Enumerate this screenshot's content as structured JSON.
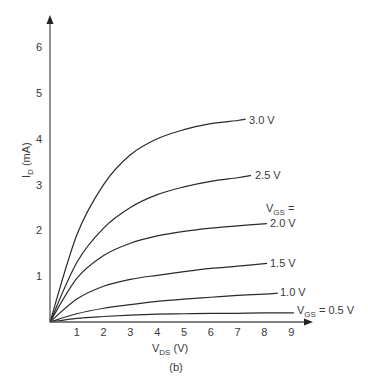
{
  "chart_data": {
    "type": "line",
    "title": "",
    "caption": "(b)",
    "xlabel": "V_DS (V)",
    "ylabel": "I_D (mA)",
    "xlim": [
      0,
      10
    ],
    "ylim": [
      0,
      6.8
    ],
    "grid": false,
    "x_ticks": [
      1,
      2,
      3,
      4,
      5,
      6,
      7,
      8,
      9
    ],
    "y_ticks": [
      1,
      2,
      3,
      4,
      5,
      6
    ],
    "legend": "inline labels at curve ends",
    "series": [
      {
        "name": "V_GS = 0.5 V",
        "label": "V_GS = 0.5 V",
        "x": [
          0,
          1,
          2,
          3,
          4,
          5,
          6,
          7,
          8,
          9.1
        ],
        "y": [
          0,
          0.08,
          0.12,
          0.15,
          0.17,
          0.18,
          0.19,
          0.19,
          0.2,
          0.2
        ]
      },
      {
        "name": "1.0 V",
        "label": "1.0 V",
        "x": [
          0,
          1,
          2,
          3,
          4,
          5,
          6,
          7,
          8,
          8.5
        ],
        "y": [
          0,
          0.18,
          0.3,
          0.38,
          0.45,
          0.5,
          0.54,
          0.58,
          0.61,
          0.63
        ]
      },
      {
        "name": "1.5 V",
        "label": "1.5 V",
        "x": [
          0,
          1,
          2,
          3,
          4,
          5,
          6,
          7,
          8.1
        ],
        "y": [
          0,
          0.5,
          0.78,
          0.93,
          1.02,
          1.1,
          1.17,
          1.22,
          1.28
        ]
      },
      {
        "name": "2.0 V",
        "label": "V_GS = 2.0 V",
        "x": [
          0,
          1,
          2,
          3,
          4,
          5,
          6,
          7,
          8.1
        ],
        "y": [
          0,
          0.95,
          1.45,
          1.72,
          1.88,
          1.98,
          2.05,
          2.1,
          2.15
        ]
      },
      {
        "name": "2.5 V",
        "label": "2.5 V",
        "x": [
          0,
          1,
          2,
          3,
          4,
          5,
          6,
          7,
          7.5
        ],
        "y": [
          0,
          1.3,
          2.05,
          2.5,
          2.78,
          2.95,
          3.07,
          3.15,
          3.2
        ]
      },
      {
        "name": "3.0 V",
        "label": "3.0 V",
        "x": [
          0,
          1,
          2,
          3,
          4,
          5,
          6,
          7,
          7.3
        ],
        "y": [
          0,
          1.9,
          3.0,
          3.65,
          4.0,
          4.2,
          4.33,
          4.4,
          4.43
        ]
      }
    ]
  },
  "labels": {
    "y_axis_main": "I",
    "y_axis_sub": "D",
    "y_axis_unit": " (mA)",
    "x_axis_main": "V",
    "x_axis_sub": "DS",
    "x_axis_unit": " (V)",
    "caption": "(b)",
    "vgs_main": "V",
    "vgs_sub": "GS",
    "vgs_eq": " =",
    "c30": "3.0 V",
    "c25": "2.5 V",
    "c20": "2.0 V",
    "c15": "1.5 V",
    "c10": "1.0 V",
    "c05": " = 0.5 V",
    "ticks_x": [
      "1",
      "2",
      "3",
      "4",
      "5",
      "6",
      "7",
      "8",
      "9"
    ],
    "ticks_y": [
      "1",
      "2",
      "3",
      "4",
      "5",
      "6"
    ]
  }
}
